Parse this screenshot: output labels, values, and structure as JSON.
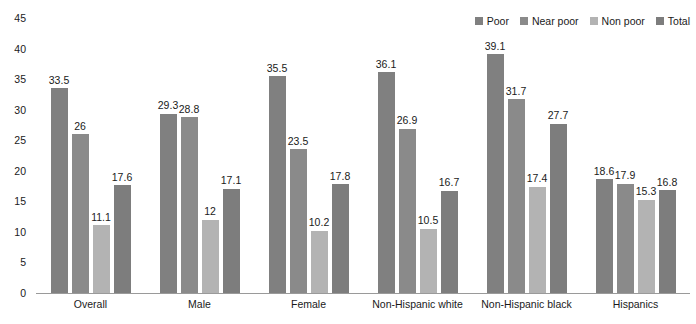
{
  "chart_data": {
    "type": "bar",
    "title": "",
    "subtitle": "",
    "xlabel": "",
    "ylabel": "",
    "ylim": [
      0,
      45
    ],
    "yticks": [
      0,
      5,
      10,
      15,
      20,
      25,
      30,
      35,
      40,
      45
    ],
    "grid": false,
    "legend_position": "top-right",
    "categories": [
      "Overall",
      "Male",
      "Female",
      "Non-Hispanic white",
      "Non-Hispanic black",
      "Hispanics"
    ],
    "series": [
      {
        "name": "Poor",
        "color": "#808080",
        "values": [
          33.5,
          29.3,
          35.5,
          36.1,
          39.1,
          18.6
        ],
        "labels": [
          "33.5",
          "29.3",
          "35.5",
          "36.1",
          "39.1",
          "18.6"
        ]
      },
      {
        "name": "Near poor",
        "color": "#8a8a8a",
        "values": [
          26,
          28.8,
          23.5,
          26.9,
          31.7,
          17.9
        ],
        "labels": [
          "26",
          "28.8",
          "23.5",
          "26.9",
          "31.7",
          "17.9"
        ]
      },
      {
        "name": "Non poor",
        "color": "#b3b3b3",
        "values": [
          11.1,
          12,
          10.2,
          10.5,
          17.4,
          15.3
        ],
        "labels": [
          "11.1",
          "12",
          "10.2",
          "10.5",
          "17.4",
          "15.3"
        ]
      },
      {
        "name": "Total",
        "color": "#7d7d7d",
        "values": [
          17.6,
          17.1,
          17.8,
          16.7,
          27.7,
          16.8
        ],
        "labels": [
          "17.6",
          "17.1",
          "17.8",
          "16.7",
          "27.7",
          "16.8"
        ]
      }
    ]
  },
  "axis": {
    "baseline_color": "#9a9a9a",
    "tick_text_color": "#1a1a1a"
  }
}
